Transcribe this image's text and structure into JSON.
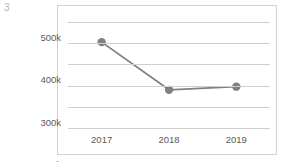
{
  "page_number": "3",
  "colors": {
    "series_line": "#808080",
    "marker": "#808080",
    "gridline": "#cfcfcf",
    "frame_border": "#d2d2d2",
    "tick_label": "#5a5a5a",
    "page_number": "#b5b5b5",
    "background": "#ffffff"
  },
  "chart_data": {
    "type": "line",
    "title": "",
    "subtitle": "",
    "xlabel": "",
    "ylabel": "",
    "categories": [
      "2017",
      "2018",
      "2019"
    ],
    "values": [
      405000,
      180000,
      195000
    ],
    "series": [
      {
        "name": "",
        "values": [
          405000,
          180000,
          195000
        ]
      }
    ],
    "ylim": [
      0,
      500000
    ],
    "yticks": [
      0,
      100000,
      200000,
      300000,
      400000,
      500000
    ],
    "ytick_labels": [
      "0",
      "100k",
      "200k",
      "300k",
      "400k",
      "500k"
    ],
    "xtick_labels": [
      "2017",
      "2018",
      "2019"
    ],
    "grid": true,
    "grid_axis": "y",
    "legend": false,
    "legend_position": "none",
    "markers": true,
    "marker_shape": "circle",
    "annotations": []
  }
}
